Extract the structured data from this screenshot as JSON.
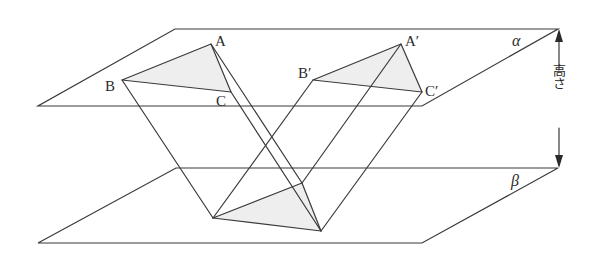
{
  "diagram": {
    "planes": [
      {
        "id": "alpha",
        "label": "α"
      },
      {
        "id": "beta",
        "label": "β"
      }
    ],
    "vertices": {
      "A": "A",
      "B": "B",
      "C": "C",
      "A_prime": "A′",
      "B_prime": "B′",
      "C_prime": "C′"
    },
    "height_label": "高さ",
    "colors": {
      "line": "#3a3a3a",
      "triangle_fill": "#eeeeee"
    }
  }
}
